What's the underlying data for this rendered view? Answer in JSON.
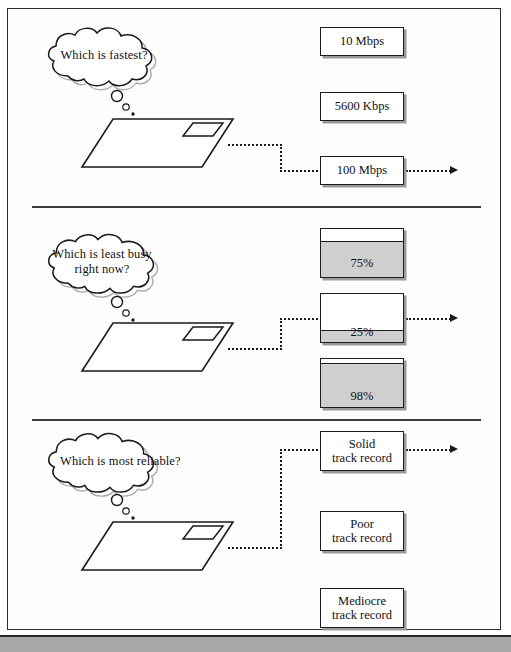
{
  "figure": {
    "background": "#ffffff",
    "page_border_color": "#2a2a2a",
    "line_color": "#1a1a1a",
    "fill_gray": "#cfcfcf",
    "shadow_gray": "#9a9a9a",
    "bottom_bar_color": "#a8a8a8"
  },
  "sections": [
    {
      "id": "speed",
      "question": "Which is fastest?",
      "question_lines": [
        "Which is fastest?"
      ],
      "node_label": "network-plane",
      "option_type": "box",
      "options": [
        {
          "label": "10 Mbps",
          "selected": false
        },
        {
          "label": "5600 Kbps",
          "selected": false
        },
        {
          "label": "100 Mbps",
          "selected": true
        }
      ],
      "selected_index": 2
    },
    {
      "id": "congestion",
      "question": "Which is least busy right now?",
      "question_lines": [
        "Which is least",
        "busy right now?"
      ],
      "node_label": "network-plane",
      "option_type": "gauge",
      "options": [
        {
          "label": "75%",
          "value": 75,
          "selected": false
        },
        {
          "label": "25%",
          "value": 25,
          "selected": true
        },
        {
          "label": "98%",
          "value": 98,
          "selected": false
        }
      ],
      "selected_index": 1
    },
    {
      "id": "reliability",
      "question": "Which is most reliable?",
      "question_lines": [
        "Which is most",
        "reliable?"
      ],
      "node_label": "network-plane",
      "option_type": "box",
      "options": [
        {
          "label": "Solid\ntrack record",
          "selected": true
        },
        {
          "label": "Poor\ntrack record",
          "selected": false
        },
        {
          "label": "Mediocre\ntrack record",
          "selected": false
        }
      ],
      "selected_index": 0
    }
  ]
}
